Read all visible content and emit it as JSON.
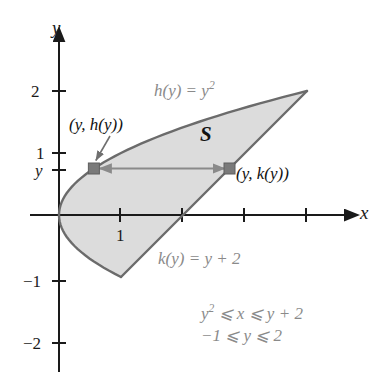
{
  "figure": {
    "colors": {
      "background": "#ffffff",
      "axis": "#1a1a1a",
      "curve": "#6b6b6b",
      "fill": "#dcdcdc",
      "gray_text": "#8a8a8a",
      "black_text": "#111111",
      "marker": "#7a7a7a",
      "arrow": "#8a8a8a"
    },
    "axes": {
      "x_label": "x",
      "y_label": "y",
      "x_ticks": [
        {
          "value": 1,
          "label": "1"
        },
        {
          "value": 2,
          "label": ""
        },
        {
          "value": 3,
          "label": ""
        },
        {
          "value": 4,
          "label": ""
        }
      ],
      "y_ticks": [
        {
          "value": 2,
          "label": "2"
        },
        {
          "value": 1,
          "label": "1"
        },
        {
          "value": 0.75,
          "label": "y"
        },
        {
          "value": -1,
          "label": "−1"
        },
        {
          "value": -2,
          "label": "−2"
        }
      ],
      "x_range": [
        -0.2,
        4.8
      ],
      "y_range": [
        -2.6,
        2.8
      ]
    },
    "labels": {
      "upper_curve": {
        "base": "h(y) = y",
        "exponent": "2"
      },
      "lower_curve": "k(y) = y + 2",
      "region": "S",
      "left_point": "(y, h(y))",
      "right_point": "(y, k(y))",
      "inequality_1": {
        "base_pre": "y",
        "exponent": "2",
        "base_post": " ⩽ x ⩽ y + 2"
      },
      "inequality_2": "−1 ⩽ y ⩽ 2"
    },
    "region": {
      "name": "S",
      "upper_boundary": "x = y^2",
      "lower_boundary": "x = y + 2",
      "intersection_points": [
        {
          "x": 1,
          "y": -1
        },
        {
          "x": 4,
          "y": 2
        }
      ],
      "sample_y": 0.75,
      "left_sample_point": {
        "x": 0.5625,
        "y": 0.75
      },
      "right_sample_point": {
        "x": 2.75,
        "y": 0.75
      }
    }
  }
}
